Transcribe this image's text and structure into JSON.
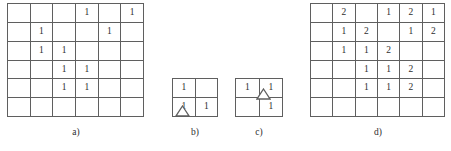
{
  "figure": {
    "background_color": "#ffffff",
    "line_color": "#5f5f5f",
    "text_color": "#2e2e2e"
  },
  "panels": [
    {
      "id": "a",
      "caption": "a)",
      "type": "grid",
      "rows": 6,
      "cols": 6,
      "cells": [
        [
          "",
          "",
          "",
          "1",
          "",
          "1"
        ],
        [
          "",
          "1",
          "",
          "",
          "1",
          ""
        ],
        [
          "",
          "1",
          "1",
          "",
          "",
          ""
        ],
        [
          "",
          "",
          "1",
          "1",
          "",
          ""
        ],
        [
          "",
          "",
          "1",
          "1",
          "",
          ""
        ],
        [
          "",
          "",
          "",
          "",
          "",
          ""
        ]
      ],
      "marker": null
    },
    {
      "id": "b",
      "caption": "b)",
      "type": "grid",
      "rows": 2,
      "cols": 2,
      "cells": [
        [
          "1",
          ""
        ],
        [
          "1",
          "1"
        ]
      ],
      "marker": {
        "shape": "triangle",
        "position": "below-bottom-left-cell"
      }
    },
    {
      "id": "c",
      "caption": "c)",
      "type": "grid",
      "rows": 2,
      "cols": 2,
      "cells": [
        [
          "1",
          "1"
        ],
        [
          "",
          "1"
        ]
      ],
      "marker": {
        "shape": "triangle",
        "position": "right-column-middle-divider"
      }
    },
    {
      "id": "d",
      "caption": "d)",
      "type": "grid",
      "rows": 6,
      "cols": 6,
      "cells": [
        [
          "",
          "2",
          "",
          "1",
          "2",
          "1"
        ],
        [
          "",
          "1",
          "2",
          "",
          "1",
          "2"
        ],
        [
          "",
          "1",
          "1",
          "2",
          "",
          ""
        ],
        [
          "",
          "",
          "1",
          "1",
          "2",
          ""
        ],
        [
          "",
          "",
          "1",
          "1",
          "2",
          ""
        ],
        [
          "",
          "",
          "",
          "",
          "",
          ""
        ]
      ],
      "marker": null
    }
  ],
  "chart_data": {
    "type": "table",
    "title": "",
    "subtitle": "",
    "xlabel": "",
    "ylabel": "",
    "legend": [],
    "grids": [
      {
        "name": "a)",
        "shape": [
          6,
          6
        ],
        "values": [
          [
            null,
            null,
            null,
            1,
            null,
            1
          ],
          [
            null,
            1,
            null,
            null,
            1,
            null
          ],
          [
            null,
            1,
            1,
            null,
            null,
            null
          ],
          [
            null,
            null,
            1,
            1,
            null,
            null
          ],
          [
            null,
            null,
            1,
            1,
            null,
            null
          ],
          [
            null,
            null,
            null,
            null,
            null,
            null
          ]
        ]
      },
      {
        "name": "b)",
        "shape": [
          2,
          2
        ],
        "values": [
          [
            1,
            null
          ],
          [
            1,
            1
          ]
        ],
        "marker": "triangle below bottom-left cell"
      },
      {
        "name": "c)",
        "shape": [
          2,
          2
        ],
        "values": [
          [
            1,
            1
          ],
          [
            null,
            1
          ]
        ],
        "marker": "triangle on divider within right column"
      },
      {
        "name": "d)",
        "shape": [
          6,
          6
        ],
        "values": [
          [
            null,
            2,
            null,
            1,
            2,
            1
          ],
          [
            null,
            1,
            2,
            null,
            1,
            2
          ],
          [
            null,
            1,
            1,
            2,
            null,
            null
          ],
          [
            null,
            null,
            1,
            1,
            2,
            null
          ],
          [
            null,
            null,
            1,
            1,
            2,
            null
          ],
          [
            null,
            null,
            null,
            null,
            null,
            null
          ]
        ]
      }
    ]
  }
}
